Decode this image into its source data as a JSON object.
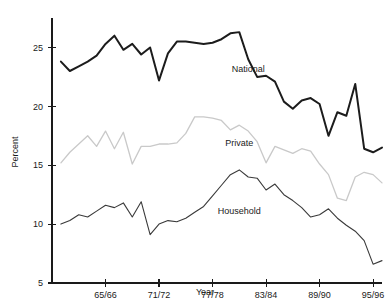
{
  "chart_data": {
    "type": "line",
    "title": "",
    "xlabel": "Year",
    "ylabel": "Percent",
    "grid": false,
    "legend_position": "inline-annotations",
    "xlim": [
      1959,
      1996
    ],
    "ylim": [
      5,
      27.5
    ],
    "yticks": [
      5,
      10,
      15,
      20,
      25
    ],
    "ytick_labels": [
      "5",
      "10",
      "15",
      "20",
      "25"
    ],
    "xticks": [
      1965,
      1971,
      1977,
      1983,
      1989,
      1995
    ],
    "xtick_labels": [
      "65/66",
      "71/72",
      "77/78",
      "83/84",
      "89/90",
      "95/96"
    ],
    "x": [
      1960,
      1961,
      1962,
      1963,
      1964,
      1965,
      1966,
      1967,
      1968,
      1969,
      1970,
      1971,
      1972,
      1973,
      1974,
      1975,
      1976,
      1977,
      1978,
      1979,
      1980,
      1981,
      1982,
      1983,
      1984,
      1985,
      1986,
      1987,
      1988,
      1989,
      1990,
      1991,
      1992,
      1993,
      1994,
      1995,
      1996
    ],
    "series": [
      {
        "name": "National",
        "color": "#1c1c1c",
        "style": "solid-bold",
        "label_x": 1981,
        "label_y": 22.9,
        "values": [
          23.8,
          23.0,
          23.4,
          23.8,
          24.3,
          25.3,
          26.0,
          24.8,
          25.3,
          24.4,
          25.0,
          22.2,
          24.5,
          25.5,
          25.5,
          25.4,
          25.3,
          25.4,
          25.7,
          26.2,
          26.3,
          24.0,
          22.5,
          22.6,
          22.1,
          20.4,
          19.8,
          20.5,
          20.7,
          20.2,
          17.5,
          19.5,
          19.2,
          21.9,
          16.4,
          16.1,
          16.5
        ]
      },
      {
        "name": "Private",
        "color": "#c9c9c9",
        "style": "solid-light",
        "label_x": 1980,
        "label_y": 16.6,
        "values": [
          15.2,
          16.1,
          16.8,
          17.5,
          16.6,
          17.9,
          16.4,
          17.8,
          15.1,
          16.6,
          16.6,
          16.8,
          16.8,
          16.9,
          17.7,
          19.1,
          19.1,
          19.0,
          18.8,
          18.0,
          18.4,
          17.9,
          17.0,
          15.2,
          16.6,
          16.3,
          16.0,
          16.4,
          16.2,
          15.1,
          14.2,
          12.2,
          12.0,
          14.0,
          14.4,
          14.2,
          13.5
        ]
      },
      {
        "name": "Household",
        "color": "#3a3a3a",
        "style": "solid-thin",
        "label_x": 1980,
        "label_y": 10.9,
        "values": [
          10.0,
          10.3,
          10.8,
          10.6,
          11.1,
          11.6,
          11.4,
          11.8,
          10.6,
          11.9,
          9.1,
          10.0,
          10.3,
          10.2,
          10.5,
          11.0,
          11.5,
          12.4,
          13.3,
          14.2,
          14.6,
          14.0,
          13.9,
          12.9,
          13.4,
          12.5,
          12.0,
          11.4,
          10.6,
          10.8,
          11.3,
          10.5,
          9.9,
          9.4,
          8.6,
          6.6,
          6.9
        ]
      }
    ]
  }
}
